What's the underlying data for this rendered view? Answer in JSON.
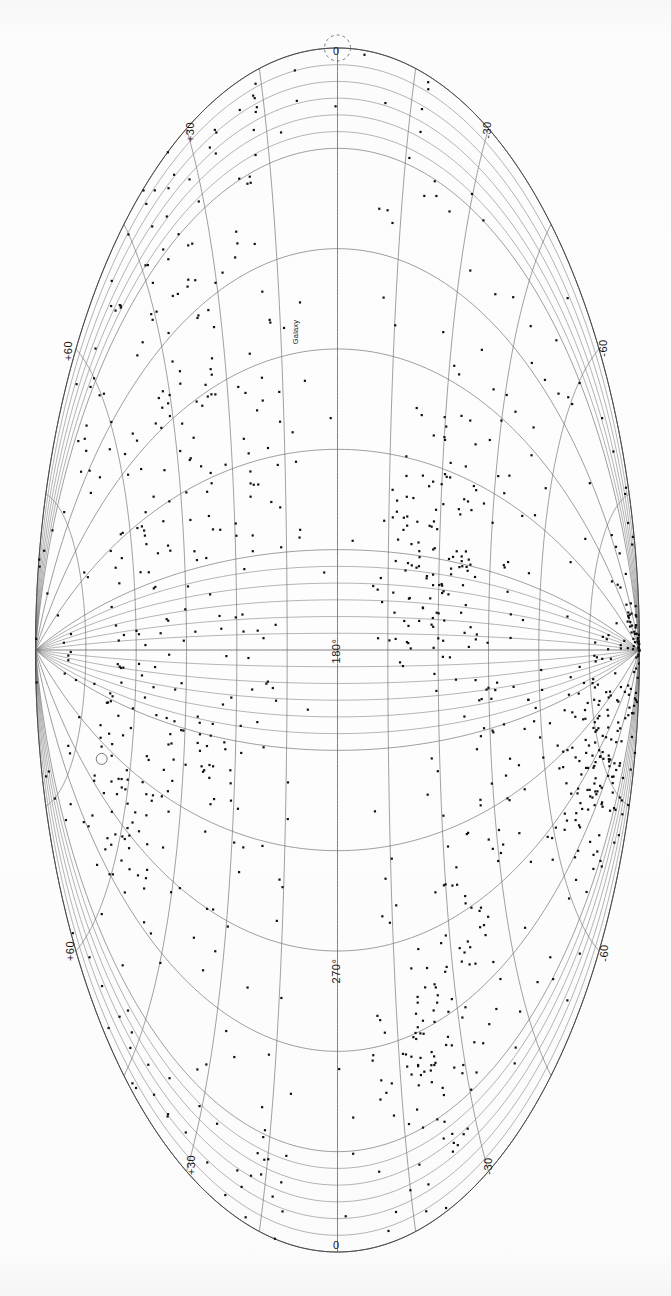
{
  "figure": {
    "projection": "aitoff",
    "background_color": "#fcfcfc",
    "grid_color": "#6b6b6b",
    "marker_color": "#111111",
    "orientation": "portrait-rotated"
  },
  "labels": {
    "top_pole": "0",
    "bottom_pole": "0",
    "center_meridian_upper": "180°",
    "center_meridian_lower": "270°",
    "top_left": "+30",
    "top_right": "-30",
    "mid_upper_left": "+60",
    "mid_upper_right": "-60",
    "mid_lower_left": "+60",
    "mid_lower_right": "-60",
    "bottom_left": "+30",
    "bottom_right": "-30",
    "feature_annotation": "Galaxy"
  },
  "chart_data": {
    "type": "scatter",
    "xlabel": "Galactic longitude",
    "ylabel": "Galactic latitude",
    "projection": "aitoff",
    "grid": true,
    "legend_position": "none",
    "longitude_range": [
      0,
      360
    ],
    "latitude_range": [
      -90,
      90
    ],
    "longitude_gridline_spacing_deg": 30,
    "latitude_gridline_spacing_deg": 15,
    "longitude_tick_labels": [
      "0",
      "180°",
      "270°",
      "0"
    ],
    "latitude_tick_labels": [
      "+30",
      "+60",
      "-30",
      "-60"
    ],
    "annotations": [
      {
        "text": "Galaxy",
        "lon": 0,
        "lat": 0,
        "marker": "dashed-circle"
      },
      {
        "text": "",
        "lon": 250,
        "lat": -68,
        "marker": "small-circle"
      }
    ],
    "point_count": 1250,
    "marker_shape": "square",
    "marker_size_px": 2.2,
    "clusters": [
      {
        "name": "galactic-center-overdensity",
        "lon": 0,
        "lat": 0,
        "n": 120,
        "spread_lon": 14,
        "spread_lat": 9
      },
      {
        "name": "virgo-supercluster",
        "lon": 283,
        "lat": 74,
        "n": 150,
        "spread_lon": 12,
        "spread_lat": 6
      },
      {
        "name": "coma-cluster",
        "lon": 58,
        "lat": 88,
        "n": 60,
        "spread_lon": 6,
        "spread_lat": 4
      },
      {
        "name": "perseus-pisces-chain",
        "lon": 150,
        "lat": 30,
        "n": 95,
        "spread_lon": 22,
        "spread_lat": 10
      },
      {
        "name": "hydra-centaurus",
        "lon": 310,
        "lat": 22,
        "n": 80,
        "spread_lon": 16,
        "spread_lat": 8
      },
      {
        "name": "supergalactic-plane-band",
        "lon": 0,
        "lat": 0,
        "n": 260,
        "spread_lon": 160,
        "spread_lat": 14
      },
      {
        "name": "southern-wall",
        "lon": 180,
        "lat": -45,
        "n": 110,
        "spread_lon": 40,
        "spread_lat": 14
      },
      {
        "name": "sculptor-void-edge",
        "lon": 240,
        "lat": -60,
        "n": 70,
        "spread_lon": 26,
        "spread_lat": 12
      },
      {
        "name": "field-galaxies-diffuse",
        "lon": 0,
        "lat": 0,
        "n": 305,
        "spread_lon": 180,
        "spread_lat": 70
      }
    ],
    "zone_of_avoidance": {
      "present": true,
      "band_half_width_deg": 8,
      "description": "sparse band along galactic equator"
    }
  }
}
